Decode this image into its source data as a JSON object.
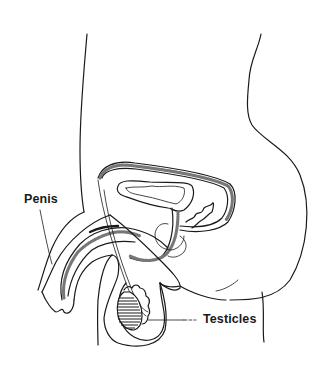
{
  "diagram": {
    "labels": [
      {
        "id": "penis",
        "text": "Penis"
      },
      {
        "id": "testicles",
        "text": "Testicles"
      }
    ],
    "colors": {
      "line": "#1a1a1a",
      "stipple": "#777777",
      "background": "#ffffff"
    }
  }
}
